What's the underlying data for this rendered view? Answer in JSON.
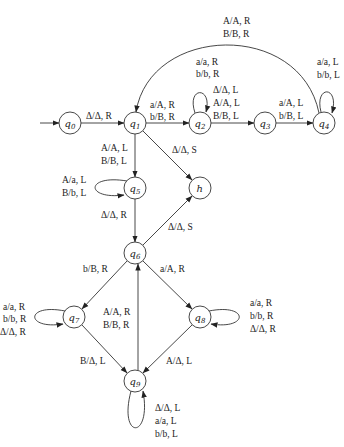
{
  "diagram": {
    "type": "turing-machine-state-diagram",
    "states": [
      {
        "id": "q0",
        "name": "q",
        "sub": "0",
        "x": 70,
        "y": 123
      },
      {
        "id": "q1",
        "name": "q",
        "sub": "1",
        "x": 135,
        "y": 123
      },
      {
        "id": "q2",
        "name": "q",
        "sub": "2",
        "x": 200,
        "y": 123
      },
      {
        "id": "q3",
        "name": "q",
        "sub": "3",
        "x": 265,
        "y": 123
      },
      {
        "id": "q4",
        "name": "q",
        "sub": "4",
        "x": 324,
        "y": 123
      },
      {
        "id": "q5",
        "name": "q",
        "sub": "5",
        "x": 135,
        "y": 188
      },
      {
        "id": "h",
        "name": "h",
        "sub": "",
        "x": 200,
        "y": 188
      },
      {
        "id": "q6",
        "name": "q",
        "sub": "6",
        "x": 135,
        "y": 253
      },
      {
        "id": "q7",
        "name": "q",
        "sub": "7",
        "x": 74,
        "y": 317
      },
      {
        "id": "q8",
        "name": "q",
        "sub": "8",
        "x": 200,
        "y": 317
      },
      {
        "id": "q9",
        "name": "q",
        "sub": "9",
        "x": 135,
        "y": 381
      }
    ],
    "start_state": "q0",
    "transitions": [
      {
        "from": "start",
        "to": "q0",
        "labels": []
      },
      {
        "from": "q0",
        "to": "q1",
        "labels": [
          "Δ/Δ, R"
        ]
      },
      {
        "from": "q1",
        "to": "q2",
        "labels": [
          "a/A, R",
          "b/B, R"
        ]
      },
      {
        "from": "q2",
        "to": "q2",
        "labels": [
          "a/a, R",
          "b/b, R"
        ]
      },
      {
        "from": "q2",
        "to": "q3",
        "labels": [
          "Δ/Δ, L",
          "A/A, L",
          "B/B, L"
        ]
      },
      {
        "from": "q3",
        "to": "q4",
        "labels": [
          "a/A, L",
          "b/B, L"
        ]
      },
      {
        "from": "q4",
        "to": "q4",
        "labels": [
          "a/a, L",
          "b/b, L"
        ]
      },
      {
        "from": "q4",
        "to": "q1",
        "labels": [
          "A/A, R",
          "B/B, R"
        ]
      },
      {
        "from": "q1",
        "to": "q5",
        "labels": [
          "A/A, L",
          "B/B, L"
        ]
      },
      {
        "from": "q1",
        "to": "h",
        "labels": [
          "Δ/Δ, S"
        ]
      },
      {
        "from": "q5",
        "to": "q5",
        "labels": [
          "A/a, L",
          "B/b, L"
        ]
      },
      {
        "from": "q5",
        "to": "q6",
        "labels": [
          "Δ/Δ, R"
        ]
      },
      {
        "from": "q6",
        "to": "h",
        "labels": [
          "Δ/Δ, S"
        ]
      },
      {
        "from": "q6",
        "to": "q7",
        "labels": [
          "b/B, R"
        ]
      },
      {
        "from": "q6",
        "to": "q8",
        "labels": [
          "a/A, R"
        ]
      },
      {
        "from": "q7",
        "to": "q7",
        "labels": [
          "a/a, R",
          "b/b, R",
          "Δ/Δ, R"
        ]
      },
      {
        "from": "q8",
        "to": "q8",
        "labels": [
          "a/a, R",
          "b/b, R",
          "Δ/Δ, R"
        ]
      },
      {
        "from": "q7",
        "to": "q9",
        "labels": [
          "B/Δ, L"
        ]
      },
      {
        "from": "q8",
        "to": "q9",
        "labels": [
          "A/Δ, L"
        ]
      },
      {
        "from": "q9",
        "to": "q6",
        "labels": [
          "A/A, R",
          "B/B, R"
        ]
      },
      {
        "from": "q9",
        "to": "q9",
        "labels": [
          "Δ/Δ, L",
          "a/a, L",
          "b/b, L"
        ]
      }
    ]
  },
  "labels": {
    "q0q1": "Δ/Δ, R",
    "q1q2_1": "a/A, R",
    "q1q2_2": "b/B, R",
    "q2loop_1": "a/a, R",
    "q2loop_2": "b/b, R",
    "q2q3_1": "Δ/Δ, L",
    "q2q3_2": "A/A, L",
    "q2q3_3": "B/B, L",
    "q3q4_1": "a/A, L",
    "q3q4_2": "b/B, L",
    "q4loop_1": "a/a, L",
    "q4loop_2": "b/b, L",
    "q4q1_1": "A/A, R",
    "q4q1_2": "B/B, R",
    "q1q5_1": "A/A, L",
    "q1q5_2": "B/B, L",
    "q1h": "Δ/Δ, S",
    "q5loop_1": "A/a, L",
    "q5loop_2": "B/b, L",
    "q5q6": "Δ/Δ, R",
    "q6h": "Δ/Δ, S",
    "q6q7": "b/B, R",
    "q6q8": "a/A, R",
    "q7loop_1": "a/a, R",
    "q7loop_2": "b/b, R",
    "q7loop_3": "Δ/Δ, R",
    "q8loop_1": "a/a, R",
    "q8loop_2": "b/b, R",
    "q8loop_3": "Δ/Δ, R",
    "q7q9": "B/Δ, L",
    "q8q9": "A/Δ, L",
    "q9q6_1": "A/A, R",
    "q9q6_2": "B/B, R",
    "q9loop_1": "Δ/Δ, L",
    "q9loop_2": "a/a, L",
    "q9loop_3": "b/b, L"
  },
  "nodes": {
    "q0": {
      "name": "q",
      "sub": "0"
    },
    "q1": {
      "name": "q",
      "sub": "1"
    },
    "q2": {
      "name": "q",
      "sub": "2"
    },
    "q3": {
      "name": "q",
      "sub": "3"
    },
    "q4": {
      "name": "q",
      "sub": "4"
    },
    "q5": {
      "name": "q",
      "sub": "5"
    },
    "h": {
      "name": "h"
    },
    "q6": {
      "name": "q",
      "sub": "6"
    },
    "q7": {
      "name": "q",
      "sub": "7"
    },
    "q8": {
      "name": "q",
      "sub": "8"
    },
    "q9": {
      "name": "q",
      "sub": "9"
    }
  }
}
